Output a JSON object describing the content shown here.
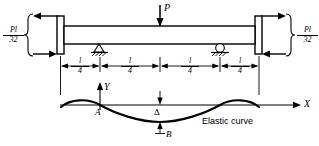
{
  "figure": {
    "type": "beam-elastic-curve-diagram",
    "background": "#ffffff",
    "ink": "#000000",
    "width": 319,
    "height": 146
  },
  "loads": {
    "point_load_label": "P",
    "point_load_position": "midspan",
    "point_load_direction": "down"
  },
  "end_moments": {
    "left": {
      "numerator": "Pl",
      "denominator": "32",
      "arrow_top": "left",
      "arrow_bottom": "right"
    },
    "right": {
      "numerator": "Pl",
      "denominator": "32",
      "arrow_top": "right",
      "arrow_bottom": "left"
    }
  },
  "supports": [
    {
      "name": "pin-support",
      "symbol": "triangle-hatched",
      "position_fraction": 0.25
    },
    {
      "name": "roller-support",
      "symbol": "circle-hatched",
      "position_fraction": 0.75
    }
  ],
  "dimensions": [
    {
      "numerator": "l",
      "denominator": "4"
    },
    {
      "numerator": "l",
      "denominator": "4"
    },
    {
      "numerator": "l",
      "denominator": "4"
    },
    {
      "numerator": "l",
      "denominator": "4"
    }
  ],
  "axes": {
    "y_label": "Y",
    "x_label": "X"
  },
  "annotations": {
    "point_a": "A",
    "point_b": "B",
    "deflection": "Δ",
    "curve_label": "Elastic curve"
  }
}
